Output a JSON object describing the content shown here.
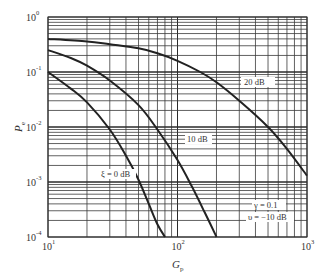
{
  "chart_data": {
    "type": "line",
    "title": "",
    "xlabel": "G_p",
    "ylabel": "P_e",
    "xscale": "log",
    "yscale": "log",
    "xlim": [
      10,
      1000
    ],
    "ylim": [
      0.0001,
      1
    ],
    "grid": true,
    "x_ticks": [
      {
        "base": "10",
        "exp": "1",
        "value": 10
      },
      {
        "base": "10",
        "exp": "2",
        "value": 100
      },
      {
        "base": "10",
        "exp": "3",
        "value": 1000
      }
    ],
    "y_ticks": [
      {
        "base": "10",
        "exp": "0",
        "value": 1
      },
      {
        "base": "10",
        "exp": "-1",
        "value": 0.1
      },
      {
        "base": "10",
        "exp": "-2",
        "value": 0.01
      },
      {
        "base": "10",
        "exp": "-3",
        "value": 0.001
      },
      {
        "base": "10",
        "exp": "-4",
        "value": 0.0001
      }
    ],
    "series": [
      {
        "name": "ξ = 0 dB",
        "x": [
          10,
          15,
          20,
          30,
          40,
          50,
          60,
          70,
          80
        ],
        "y": [
          0.1,
          0.05,
          0.028,
          0.009,
          0.003,
          0.0011,
          0.0004,
          0.00017,
          0.0001
        ]
      },
      {
        "name": "10 dB",
        "x": [
          10,
          15,
          20,
          30,
          50,
          70,
          100,
          130,
          160,
          200
        ],
        "y": [
          0.25,
          0.18,
          0.13,
          0.07,
          0.025,
          0.009,
          0.0025,
          0.0008,
          0.0003,
          0.0001
        ]
      },
      {
        "name": "20 dB",
        "x": [
          10,
          20,
          30,
          50,
          70,
          100,
          150,
          200,
          300,
          500,
          700,
          1000
        ],
        "y": [
          0.4,
          0.36,
          0.32,
          0.27,
          0.22,
          0.16,
          0.1,
          0.065,
          0.03,
          0.01,
          0.004,
          0.0013
        ]
      }
    ],
    "annotations": [
      {
        "text": "ξ = 0 dB",
        "x": 60,
        "y": 0.0012
      },
      {
        "text": "10 dB",
        "x": 180,
        "y": 0.007
      },
      {
        "text": "20 dB",
        "x": 600,
        "y": 0.14
      },
      {
        "text": "γ = 0.1",
        "x": 500,
        "y": 0.0009
      },
      {
        "text": "υ = −10 dB",
        "x": 500,
        "y": 0.00055
      }
    ]
  },
  "labels": {
    "x_axis": "G",
    "x_axis_sub": "p",
    "y_axis": "P",
    "y_axis_sub": "e",
    "curve_0": "ξ = 0 dB",
    "curve_1": "10 dB",
    "curve_2": "20 dB",
    "param_gamma": "γ = 0.1",
    "param_upsilon": "υ = −10 dB"
  }
}
